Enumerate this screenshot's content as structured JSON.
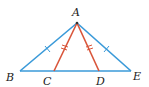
{
  "diagram": {
    "points": {
      "A": {
        "label": "A",
        "x": 77,
        "y": 23
      },
      "B": {
        "label": "B",
        "x": 20,
        "y": 71
      },
      "C": {
        "label": "C",
        "x": 54,
        "y": 71
      },
      "D": {
        "label": "D",
        "x": 99,
        "y": 71
      },
      "E": {
        "label": "E",
        "x": 131,
        "y": 71
      }
    },
    "segments": [
      {
        "from": "A",
        "to": "B",
        "color": "#3a9ad9",
        "tick_marks": 1
      },
      {
        "from": "A",
        "to": "E",
        "color": "#3a9ad9",
        "tick_marks": 1
      },
      {
        "from": "B",
        "to": "E",
        "color": "#3a9ad9",
        "tick_marks": 0
      },
      {
        "from": "A",
        "to": "C",
        "color": "#d9553a",
        "tick_marks": 2
      },
      {
        "from": "A",
        "to": "D",
        "color": "#d9553a",
        "tick_marks": 2
      }
    ],
    "colors": {
      "blue": "#3a9ad9",
      "red": "#d9553a"
    }
  }
}
